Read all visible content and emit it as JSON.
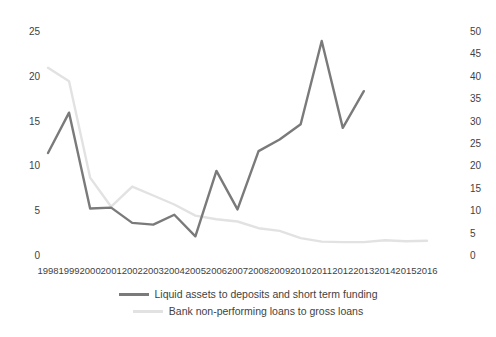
{
  "chart_data": {
    "type": "line",
    "title": "",
    "xlabel": "",
    "ylabel": "",
    "grid": false,
    "legend_position": "bottom",
    "categories": [
      "1998",
      "1999",
      "2000",
      "2001",
      "2002",
      "2003",
      "2004",
      "2005",
      "2006",
      "2007",
      "2008",
      "2009",
      "2010",
      "2011",
      "2012",
      "2013",
      "2014",
      "2015",
      "2016"
    ],
    "axes": {
      "left": {
        "ylim": [
          0,
          25
        ],
        "ticks": [
          "0",
          "5",
          "10",
          "15",
          "20",
          "25"
        ],
        "tick_values": [
          0,
          5,
          10,
          15,
          20,
          25
        ]
      },
      "right": {
        "ylim": [
          0,
          50
        ],
        "ticks": [
          "0",
          "5",
          "10",
          "15",
          "20",
          "25",
          "30",
          "35",
          "40",
          "45",
          "50"
        ],
        "tick_values": [
          0,
          5,
          10,
          15,
          20,
          25,
          30,
          35,
          40,
          45,
          50
        ]
      }
    },
    "series": [
      {
        "name": "Liquid assets to deposits and short term funding",
        "axis": "left",
        "color": "#7a7a7a",
        "values": [
          11.5,
          16.0,
          5.3,
          5.4,
          3.7,
          3.5,
          4.6,
          2.2,
          9.5,
          5.2,
          11.7,
          13.0,
          14.7,
          24.0,
          14.3,
          18.4,
          null,
          null,
          null
        ]
      },
      {
        "name": "Bank non-performing loans to gross loans",
        "axis": "right",
        "color": "#e2e2e2",
        "values": [
          42.0,
          39.0,
          17.5,
          11.0,
          15.5,
          13.5,
          11.5,
          9.0,
          8.2,
          7.7,
          6.2,
          5.6,
          4.0,
          3.2,
          3.1,
          3.1,
          3.5,
          3.3,
          3.4
        ]
      }
    ]
  },
  "legend": {
    "entries": [
      {
        "label": "Liquid assets to deposits and short term funding",
        "color": "#7a7a7a"
      },
      {
        "label": "Bank non-performing loans to gross loans",
        "color": "#e2e2e2"
      }
    ]
  }
}
